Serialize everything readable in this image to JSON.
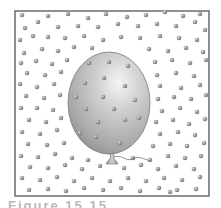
{
  "figure": {
    "frame": {
      "x": 15,
      "y": 11,
      "width": 194,
      "height": 185,
      "stroke": "#555555"
    },
    "balloon": {
      "cx": 109,
      "cy": 103,
      "rx": 41,
      "ry": 51,
      "fill_light": "#d8d8d8",
      "fill_dark": "#8e8e8e",
      "highlight": "#f2f2f2",
      "knot": {
        "x": 112,
        "y": 156
      },
      "string_color": "#777777"
    },
    "molecule_color": "#9a9a9a",
    "molecule_highlight": "#dcdcdc",
    "molecule_radius": 2.3,
    "inside_molecules": [
      [
        89,
        63
      ],
      [
        109,
        62
      ],
      [
        128,
        66
      ],
      [
        85,
        83
      ],
      [
        104,
        78
      ],
      [
        125,
        86
      ],
      [
        76,
        97
      ],
      [
        103,
        97
      ],
      [
        135,
        100
      ],
      [
        86,
        109
      ],
      [
        114,
        109
      ],
      [
        139,
        118
      ],
      [
        98,
        122
      ],
      [
        125,
        120
      ],
      [
        80,
        133
      ],
      [
        96,
        137
      ],
      [
        120,
        143
      ]
    ],
    "outside_molecules": [
      [
        22,
        15
      ],
      [
        48,
        16
      ],
      [
        68,
        14
      ],
      [
        88,
        18
      ],
      [
        106,
        14
      ],
      [
        127,
        17
      ],
      [
        146,
        15
      ],
      [
        165,
        12
      ],
      [
        183,
        16
      ],
      [
        200,
        14
      ],
      [
        25,
        28
      ],
      [
        38,
        22
      ],
      [
        58,
        27
      ],
      [
        78,
        26
      ],
      [
        98,
        27
      ],
      [
        118,
        24
      ],
      [
        138,
        26
      ],
      [
        157,
        24
      ],
      [
        176,
        26
      ],
      [
        195,
        22
      ],
      [
        205,
        30
      ],
      [
        20,
        40
      ],
      [
        33,
        36
      ],
      [
        48,
        37
      ],
      [
        65,
        38
      ],
      [
        84,
        36
      ],
      [
        103,
        40
      ],
      [
        121,
        37
      ],
      [
        140,
        38
      ],
      [
        160,
        36
      ],
      [
        179,
        38
      ],
      [
        197,
        40
      ],
      [
        24,
        53
      ],
      [
        42,
        49
      ],
      [
        58,
        51
      ],
      [
        74,
        47
      ],
      [
        92,
        48
      ],
      [
        149,
        49
      ],
      [
        168,
        51
      ],
      [
        186,
        48
      ],
      [
        203,
        52
      ],
      [
        21,
        63
      ],
      [
        36,
        61
      ],
      [
        52,
        64
      ],
      [
        67,
        60
      ],
      [
        155,
        62
      ],
      [
        172,
        60
      ],
      [
        190,
        63
      ],
      [
        206,
        60
      ],
      [
        27,
        73
      ],
      [
        45,
        75
      ],
      [
        61,
        72
      ],
      [
        157,
        75
      ],
      [
        176,
        73
      ],
      [
        194,
        76
      ],
      [
        20,
        84
      ],
      [
        37,
        87
      ],
      [
        54,
        84
      ],
      [
        160,
        86
      ],
      [
        181,
        88
      ],
      [
        200,
        85
      ],
      [
        26,
        96
      ],
      [
        44,
        98
      ],
      [
        60,
        95
      ],
      [
        158,
        99
      ],
      [
        174,
        97
      ],
      [
        191,
        99
      ],
      [
        206,
        95
      ],
      [
        21,
        108
      ],
      [
        37,
        108
      ],
      [
        53,
        110
      ],
      [
        162,
        111
      ],
      [
        180,
        108
      ],
      [
        197,
        112
      ],
      [
        29,
        120
      ],
      [
        46,
        122
      ],
      [
        61,
        118
      ],
      [
        156,
        122
      ],
      [
        173,
        120
      ],
      [
        189,
        124
      ],
      [
        205,
        119
      ],
      [
        22,
        132
      ],
      [
        40,
        134
      ],
      [
        57,
        130
      ],
      [
        160,
        134
      ],
      [
        178,
        132
      ],
      [
        195,
        135
      ],
      [
        28,
        144
      ],
      [
        47,
        145
      ],
      [
        64,
        143
      ],
      [
        153,
        146
      ],
      [
        170,
        144
      ],
      [
        187,
        146
      ],
      [
        204,
        143
      ],
      [
        21,
        156
      ],
      [
        38,
        157
      ],
      [
        55,
        154
      ],
      [
        72,
        158
      ],
      [
        88,
        160
      ],
      [
        133,
        158
      ],
      [
        150,
        160
      ],
      [
        168,
        156
      ],
      [
        185,
        158
      ],
      [
        201,
        156
      ],
      [
        30,
        167
      ],
      [
        48,
        168
      ],
      [
        65,
        165
      ],
      [
        82,
        169
      ],
      [
        100,
        166
      ],
      [
        124,
        168
      ],
      [
        141,
        165
      ],
      [
        158,
        169
      ],
      [
        176,
        166
      ],
      [
        194,
        169
      ],
      [
        22,
        178
      ],
      [
        40,
        180
      ],
      [
        57,
        177
      ],
      [
        74,
        181
      ],
      [
        92,
        178
      ],
      [
        110,
        181
      ],
      [
        128,
        178
      ],
      [
        146,
        181
      ],
      [
        164,
        178
      ],
      [
        182,
        180
      ],
      [
        200,
        177
      ],
      [
        29,
        190
      ],
      [
        48,
        189
      ],
      [
        66,
        191
      ],
      [
        84,
        188
      ],
      [
        103,
        190
      ],
      [
        121,
        188
      ],
      [
        140,
        191
      ],
      [
        159,
        188
      ],
      [
        170,
        192
      ],
      [
        177,
        190
      ],
      [
        196,
        189
      ]
    ]
  },
  "caption": {
    "text": "Figure 15.15"
  }
}
